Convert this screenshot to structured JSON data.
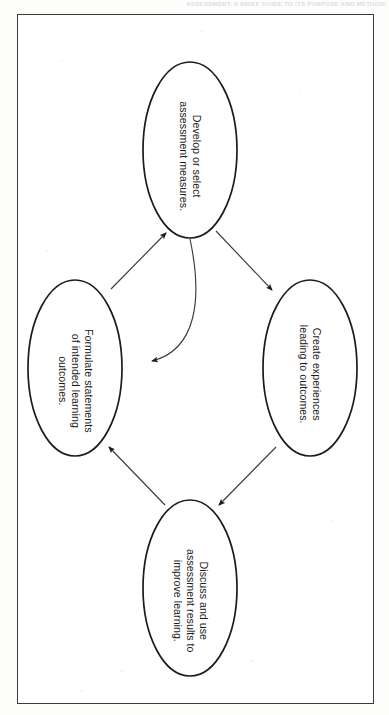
{
  "page": {
    "running_head": "ASSESSMENT: A BRIEF GUIDE TO ITS PURPOSE AND METHODS",
    "background_color": "#fdfdfc",
    "frame_color": "#3b3b3b",
    "orientation": "rotated-90"
  },
  "figure": {
    "type": "cycle-diagram",
    "node_count": 4,
    "stroke_color": "#1c1c1c",
    "fill_color": "#ffffff",
    "nodes": [
      {
        "id": "develop-assessment-measures",
        "label": "Develop or select\nassessment measures.",
        "position": "top",
        "cx": 190,
        "cy": 150,
        "rx": 47,
        "ry": 88
      },
      {
        "id": "formulate-learning-outcomes",
        "label": "Formulate statements\nof intended learning\noutcomes.",
        "position": "left",
        "cx": 75,
        "cy": 368,
        "rx": 47,
        "ry": 88
      },
      {
        "id": "create-experiences",
        "label": "Create experiences\nleading to outcomes.",
        "position": "right",
        "cx": 310,
        "cy": 368,
        "rx": 47,
        "ry": 88
      },
      {
        "id": "discuss-assessment-results",
        "label": "Discuss and use\nassessment results to\nimprove learning.",
        "position": "bottom",
        "cx": 190,
        "cy": 588,
        "rx": 47,
        "ry": 88
      }
    ],
    "edges": [
      {
        "id": "outcomes-to-measures",
        "from": "formulate-learning-outcomes",
        "to": "develop-assessment-measures",
        "style": "straight",
        "arrowhead": "to"
      },
      {
        "id": "measures-to-experiences",
        "from": "develop-assessment-measures",
        "to": "create-experiences",
        "style": "straight",
        "arrowhead": "to"
      },
      {
        "id": "experiences-to-discuss",
        "from": "create-experiences",
        "to": "discuss-assessment-results",
        "style": "straight",
        "arrowhead": "to"
      },
      {
        "id": "discuss-to-outcomes",
        "from": "discuss-assessment-results",
        "to": "formulate-learning-outcomes",
        "style": "straight",
        "arrowhead": "to"
      },
      {
        "id": "measures-back-to-outcomes",
        "from": "develop-assessment-measures",
        "to": "formulate-learning-outcomes",
        "style": "curved-feedback",
        "arrowhead": "to"
      }
    ]
  }
}
